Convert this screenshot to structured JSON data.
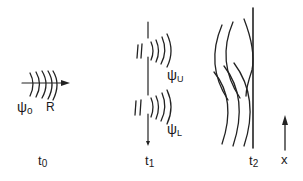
{
  "figure": {
    "type": "wave packet time-sequence diagram",
    "panels": [
      {
        "id": "t0",
        "time_label": "t",
        "time_subscript": "0",
        "wave_label": "ψ",
        "wave_subscript": "o",
        "arrow_label": "R"
      },
      {
        "id": "t1",
        "time_label": "t",
        "time_subscript": "1",
        "upper_wave_label": "ψ",
        "upper_wave_subscript": "U",
        "lower_wave_label": "ψ",
        "lower_wave_subscript": "L"
      },
      {
        "id": "t2",
        "time_label": "t",
        "time_subscript": "2"
      }
    ],
    "axis": {
      "label": "x",
      "direction": "up"
    },
    "colors": {
      "ink": "#222222",
      "background": "#ffffff"
    }
  }
}
